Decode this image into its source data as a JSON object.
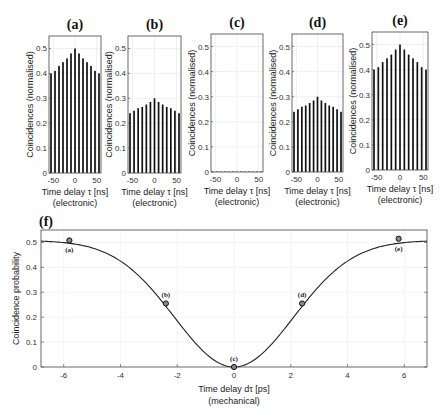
{
  "figure": {
    "top_panels_common": {
      "ylabel": "Coincidences (normalised)",
      "xlabel_line1": "Time delay τ [ns]",
      "xlabel_line2": "(electronic)",
      "xticks": [
        "-50",
        "0",
        "50"
      ],
      "yticks": [
        "0",
        "0.1",
        "0.2",
        "0.3",
        "0.4",
        "0.5"
      ]
    },
    "bottom_panel": {
      "tag": "(f)",
      "ylabel": "Coincidence probability",
      "xlabel_line1": "Time delay dτ [ps]",
      "xlabel_line2": "(mechanical)",
      "xticks": [
        "-6",
        "-4",
        "-2",
        "0",
        "2",
        "4",
        "6"
      ],
      "yticks": [
        "0",
        "0.1",
        "0.2",
        "0.3",
        "0.4",
        "0.5"
      ]
    }
  },
  "chart_data": [
    {
      "type": "bar",
      "panel": "(a)",
      "title": "(a)",
      "xlabel": "Time delay τ [ns] (electronic)",
      "ylabel": "Coincidences (normalised)",
      "x": [
        -60,
        -50,
        -40,
        -30,
        -20,
        -10,
        0,
        10,
        20,
        30,
        40,
        50,
        60
      ],
      "values": [
        0.4,
        0.41,
        0.43,
        0.445,
        0.46,
        0.48,
        0.5,
        0.48,
        0.46,
        0.445,
        0.43,
        0.41,
        0.4
      ],
      "xlim": [
        -60,
        60
      ],
      "ylim": [
        0,
        0.55
      ],
      "grid": true
    },
    {
      "type": "bar",
      "panel": "(b)",
      "title": "(b)",
      "xlabel": "Time delay τ [ns] (electronic)",
      "ylabel": "Coincidences (normalised)",
      "x": [
        -60,
        -50,
        -40,
        -30,
        -20,
        -10,
        0,
        10,
        20,
        30,
        40,
        50,
        60
      ],
      "values": [
        0.24,
        0.25,
        0.26,
        0.265,
        0.275,
        0.285,
        0.3,
        0.285,
        0.275,
        0.265,
        0.26,
        0.25,
        0.24
      ],
      "xlim": [
        -60,
        60
      ],
      "ylim": [
        0,
        0.55
      ],
      "grid": true
    },
    {
      "type": "bar",
      "panel": "(c)",
      "title": "(c)",
      "xlabel": "Time delay τ [ns] (electronic)",
      "ylabel": "Coincidences (normalised)",
      "x": [
        -60,
        -50,
        -40,
        -30,
        -20,
        -10,
        0,
        10,
        20,
        30,
        40,
        50,
        60
      ],
      "values": [
        0.002,
        0.002,
        0.002,
        0.002,
        0.002,
        0.002,
        0.002,
        0.002,
        0.002,
        0.002,
        0.002,
        0.002,
        0.002
      ],
      "xlim": [
        -60,
        60
      ],
      "ylim": [
        0,
        0.55
      ],
      "grid": true
    },
    {
      "type": "bar",
      "panel": "(d)",
      "title": "(d)",
      "xlabel": "Time delay τ [ns] (electronic)",
      "ylabel": "Coincidences (normalised)",
      "x": [
        -60,
        -50,
        -40,
        -30,
        -20,
        -10,
        0,
        10,
        20,
        30,
        40,
        50,
        60
      ],
      "values": [
        0.24,
        0.25,
        0.26,
        0.265,
        0.275,
        0.285,
        0.3,
        0.285,
        0.275,
        0.265,
        0.26,
        0.25,
        0.24
      ],
      "xlim": [
        -60,
        60
      ],
      "ylim": [
        0,
        0.55
      ],
      "grid": true
    },
    {
      "type": "bar",
      "panel": "(e)",
      "title": "(e)",
      "xlabel": "Time delay τ [ns] (electronic)",
      "ylabel": "Coincidences (normalised)",
      "x": [
        -60,
        -50,
        -40,
        -30,
        -20,
        -10,
        0,
        10,
        20,
        30,
        40,
        50,
        60
      ],
      "values": [
        0.4,
        0.41,
        0.43,
        0.445,
        0.46,
        0.48,
        0.5,
        0.48,
        0.46,
        0.445,
        0.43,
        0.41,
        0.4
      ],
      "xlim": [
        -60,
        60
      ],
      "ylim": [
        0,
        0.55
      ],
      "grid": true
    },
    {
      "type": "line",
      "panel": "(f)",
      "title": "(f)",
      "xlabel": "Time delay dτ [ps] (mechanical)",
      "ylabel": "Coincidence probability",
      "xlim": [
        -6.8,
        6.8
      ],
      "ylim": [
        0,
        0.55
      ],
      "grid": true,
      "curve": {
        "x": [
          -6.8,
          -6,
          -5.5,
          -5,
          -4.5,
          -4,
          -3.5,
          -3,
          -2.5,
          -2,
          -1.5,
          -1,
          -0.5,
          0,
          0.5,
          1,
          1.5,
          2,
          2.5,
          3,
          3.5,
          4,
          4.5,
          5,
          5.5,
          6,
          6.8
        ],
        "y": [
          0.502,
          0.508,
          0.508,
          0.503,
          0.487,
          0.455,
          0.407,
          0.348,
          0.283,
          0.214,
          0.147,
          0.086,
          0.034,
          0.005,
          0.034,
          0.086,
          0.147,
          0.214,
          0.283,
          0.348,
          0.407,
          0.455,
          0.487,
          0.503,
          0.508,
          0.508,
          0.502
        ]
      },
      "markers": [
        {
          "label": "(a)",
          "x": -5.8,
          "y": 0.508
        },
        {
          "label": "(b)",
          "x": -2.4,
          "y": 0.255
        },
        {
          "label": "(c)",
          "x": 0.0,
          "y": 0.0
        },
        {
          "label": "(d)",
          "x": 2.4,
          "y": 0.255
        },
        {
          "label": "(e)",
          "x": 5.8,
          "y": 0.515
        }
      ]
    }
  ]
}
